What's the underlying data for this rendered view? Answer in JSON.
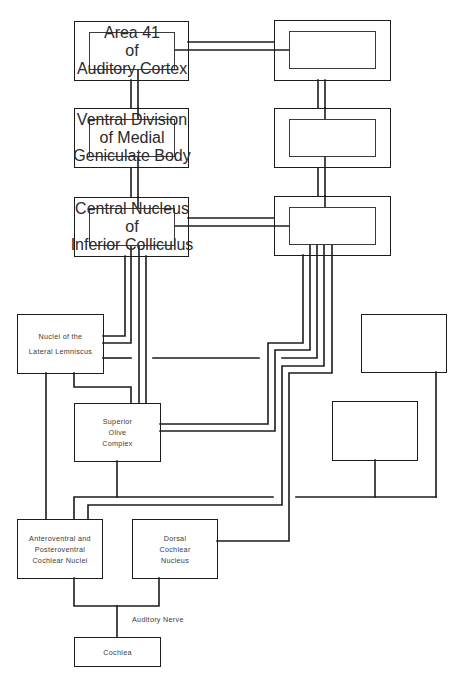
{
  "diagram": {
    "type": "auditory-pathway-block-diagram",
    "nodes": {
      "area41": {
        "lines": [
          "Area 41",
          "of",
          "Auditory Cortex"
        ]
      },
      "area41_right": {
        "lines": []
      },
      "mgb": {
        "lines": [
          "Ventral Division",
          "of Medial",
          "Geniculate Body"
        ]
      },
      "mgb_right": {
        "lines": []
      },
      "ic": {
        "lines": [
          "Central Nucleus",
          "of",
          "Inferior Colliculus"
        ]
      },
      "ic_right": {
        "lines": []
      },
      "ll": {
        "lines": [
          "Nuclei of the",
          "Lateral Lemniscus"
        ]
      },
      "right_upper_blank": {
        "lines": []
      },
      "soc": {
        "lines": [
          "Superior",
          "Olive",
          "Complex"
        ]
      },
      "right_lower_blank": {
        "lines": []
      },
      "avcn_pvcn": {
        "lines": [
          "Anteroventral and",
          "Posteroventral",
          "Cochlear Nuclei"
        ]
      },
      "dcn": {
        "lines": [
          "Dorsal",
          "Cochlear",
          "Nucleus"
        ]
      },
      "cochlea": {
        "lines": [
          "Cochlea"
        ]
      }
    },
    "edge_labels": {
      "auditory_nerve": "Auditory Nerve"
    },
    "colors": {
      "line": "#1c1c1c",
      "background": "#ffffff",
      "text": "#3b3b3b"
    }
  }
}
